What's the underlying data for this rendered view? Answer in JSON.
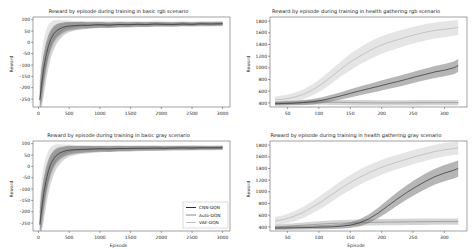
{
  "legend": {
    "entries": [
      {
        "label": "CNN-DQN",
        "color": "#2f2f2f"
      },
      {
        "label": "Auto-DQN",
        "color": "#8b8b8b"
      },
      {
        "label": "VAE-DQN",
        "color": "#c2c2c2"
      }
    ]
  },
  "chart_data": [
    {
      "type": "line",
      "title": "Reward by episode during training in basic rgb scenario",
      "xlabel": "",
      "ylabel": "Reward",
      "xlim": [
        -90,
        3120
      ],
      "ylim": [
        -285,
        112
      ],
      "xticks": [
        0,
        500,
        1000,
        1500,
        2000,
        2500,
        3000
      ],
      "yticks": [
        100,
        50,
        0,
        -50,
        -100,
        -150,
        -200,
        -250
      ],
      "show_legend": false,
      "x": [
        20,
        50,
        80,
        120,
        160,
        200,
        250,
        300,
        350,
        400,
        450,
        500,
        600,
        700,
        800,
        900,
        1000,
        1150,
        1300,
        1450,
        1600,
        1750,
        1900,
        2050,
        2200,
        2350,
        2500,
        2650,
        2800,
        2950,
        3000
      ],
      "series": [
        {
          "name": "VAE-DQN",
          "color": "#b5b5b5",
          "fill": "#cfcfcf",
          "fill_opacity": 0.55,
          "mean": [
            -245,
            -165,
            -105,
            -42,
            -2,
            24,
            44,
            56,
            63,
            67,
            71,
            73,
            75,
            76,
            77,
            78,
            78,
            79,
            79,
            80,
            80,
            80,
            81,
            81,
            81,
            82,
            81,
            82,
            82,
            82,
            82
          ],
          "band": [
            100,
            120,
            110,
            95,
            80,
            66,
            54,
            44,
            37,
            31,
            27,
            24,
            20,
            18,
            17,
            16,
            15,
            14,
            14,
            13,
            13,
            12,
            12,
            12,
            11,
            11,
            11,
            11,
            11,
            11,
            11
          ]
        },
        {
          "name": "Auto-DQN",
          "color": "#8b8b8b",
          "fill": "#9f9f9f",
          "fill_opacity": 0.45,
          "mean": [
            -250,
            -205,
            -155,
            -95,
            -48,
            -10,
            18,
            36,
            48,
            57,
            63,
            67,
            71,
            74,
            75,
            76,
            77,
            77,
            78,
            78,
            79,
            79,
            80,
            80,
            80,
            81,
            80,
            81,
            81,
            82,
            82
          ],
          "band": [
            80,
            95,
            90,
            80,
            68,
            58,
            48,
            40,
            34,
            28,
            25,
            22,
            19,
            17,
            15,
            14,
            13,
            13,
            12,
            12,
            11,
            11,
            11,
            10,
            10,
            10,
            10,
            10,
            10,
            10,
            10
          ]
        },
        {
          "name": "CNN-DQN",
          "color": "#2f2f2f",
          "fill": "#6e6e6e",
          "fill_opacity": 0.5,
          "mean": [
            -255,
            -185,
            -125,
            -62,
            -18,
            14,
            38,
            52,
            60,
            66,
            70,
            72,
            74,
            76,
            75,
            77,
            78,
            76,
            79,
            78,
            80,
            79,
            81,
            80,
            79,
            81,
            80,
            82,
            81,
            82,
            82
          ],
          "band": [
            60,
            75,
            70,
            60,
            50,
            42,
            35,
            30,
            26,
            22,
            20,
            18,
            16,
            14,
            13,
            12,
            12,
            11,
            11,
            10,
            10,
            10,
            9,
            9,
            9,
            9,
            8,
            8,
            8,
            8,
            8
          ]
        }
      ]
    },
    {
      "type": "line",
      "title": "Reward by episode during training in health gathering rgb scenario",
      "xlabel": "",
      "ylabel": "Reward",
      "xlim": [
        22,
        336
      ],
      "ylim": [
        330,
        1870
      ],
      "xticks": [
        50,
        100,
        150,
        200,
        250,
        300
      ],
      "yticks": [
        1800,
        1600,
        1400,
        1200,
        1000,
        800,
        600,
        400
      ],
      "show_legend": false,
      "x": [
        30,
        45,
        60,
        75,
        90,
        105,
        120,
        135,
        150,
        165,
        180,
        195,
        210,
        225,
        240,
        255,
        270,
        285,
        300,
        315,
        322
      ],
      "series": [
        {
          "name": "VAE-DQN",
          "color": "#b5b5b5",
          "fill": "#cfcfcf",
          "fill_opacity": 0.55,
          "mean": [
            450,
            465,
            495,
            545,
            625,
            725,
            850,
            980,
            1100,
            1200,
            1290,
            1370,
            1430,
            1480,
            1530,
            1570,
            1610,
            1640,
            1660,
            1680,
            1690
          ],
          "band": [
            60,
            65,
            75,
            85,
            95,
            110,
            120,
            130,
            140,
            145,
            150,
            150,
            150,
            148,
            145,
            142,
            140,
            138,
            135,
            132,
            130
          ]
        },
        {
          "name": "Auto-DQN",
          "color": "#8b8b8b",
          "fill": "#9f9f9f",
          "fill_opacity": 0.45,
          "mean": [
            395,
            400,
            405,
            408,
            410,
            412,
            410,
            408,
            405,
            403,
            402,
            400,
            400,
            401,
            402,
            403,
            404,
            404,
            405,
            405,
            405
          ],
          "band": [
            35,
            36,
            38,
            40,
            42,
            44,
            45,
            46,
            46,
            46,
            46,
            45,
            45,
            45,
            45,
            45,
            45,
            45,
            45,
            45,
            45
          ]
        },
        {
          "name": "CNN-DQN",
          "color": "#2f2f2f",
          "fill": "#6e6e6e",
          "fill_opacity": 0.5,
          "mean": [
            385,
            390,
            395,
            405,
            420,
            445,
            480,
            520,
            565,
            605,
            645,
            685,
            725,
            765,
            805,
            850,
            890,
            930,
            960,
            1000,
            1040
          ],
          "band": [
            30,
            32,
            35,
            40,
            45,
            52,
            58,
            64,
            70,
            75,
            80,
            84,
            88,
            92,
            95,
            98,
            100,
            103,
            105,
            108,
            110
          ]
        }
      ]
    },
    {
      "type": "line",
      "title": "Reward by episode during training in basic gray scenario",
      "xlabel": "Episode",
      "ylabel": "Reward",
      "xlim": [
        -90,
        3120
      ],
      "ylim": [
        -285,
        112
      ],
      "xticks": [
        0,
        500,
        1000,
        1500,
        2000,
        2500,
        3000
      ],
      "yticks": [
        100,
        50,
        0,
        -50,
        -100,
        -150,
        -200,
        -250
      ],
      "show_legend": true,
      "x": [
        20,
        50,
        80,
        120,
        160,
        200,
        250,
        300,
        350,
        400,
        450,
        500,
        600,
        700,
        800,
        900,
        1000,
        1150,
        1300,
        1450,
        1600,
        1750,
        1900,
        2050,
        2200,
        2350,
        2500,
        2650,
        2800,
        2950,
        3000
      ],
      "series": [
        {
          "name": "VAE-DQN",
          "color": "#b5b5b5",
          "fill": "#cfcfcf",
          "fill_opacity": 0.55,
          "mean": [
            -240,
            -170,
            -110,
            -50,
            -8,
            20,
            42,
            55,
            62,
            67,
            70,
            73,
            75,
            76,
            77,
            77,
            78,
            79,
            80,
            79,
            80,
            81,
            80,
            81,
            82,
            81,
            82,
            82,
            81,
            82,
            82
          ],
          "band": [
            105,
            118,
            108,
            92,
            78,
            64,
            52,
            43,
            36,
            30,
            26,
            23,
            20,
            18,
            16,
            15,
            15,
            14,
            13,
            13,
            12,
            12,
            12,
            11,
            11,
            11,
            11,
            11,
            10,
            10,
            10
          ]
        },
        {
          "name": "Auto-DQN",
          "color": "#8b8b8b",
          "fill": "#9f9f9f",
          "fill_opacity": 0.45,
          "mean": [
            -252,
            -208,
            -158,
            -98,
            -52,
            -14,
            15,
            34,
            46,
            55,
            62,
            66,
            70,
            73,
            74,
            75,
            76,
            77,
            78,
            78,
            79,
            79,
            79,
            80,
            80,
            80,
            81,
            81,
            81,
            82,
            82
          ],
          "band": [
            82,
            96,
            92,
            82,
            70,
            60,
            50,
            41,
            35,
            29,
            26,
            23,
            20,
            17,
            16,
            15,
            14,
            13,
            13,
            12,
            12,
            11,
            11,
            11,
            10,
            10,
            10,
            10,
            10,
            10,
            10
          ]
        },
        {
          "name": "CNN-DQN",
          "color": "#2f2f2f",
          "fill": "#6e6e6e",
          "fill_opacity": 0.5,
          "mean": [
            -258,
            -190,
            -130,
            -66,
            -22,
            10,
            35,
            50,
            59,
            65,
            69,
            72,
            74,
            75,
            76,
            77,
            78,
            77,
            79,
            79,
            80,
            80,
            81,
            80,
            81,
            82,
            81,
            82,
            82,
            82,
            83
          ],
          "band": [
            62,
            78,
            72,
            62,
            52,
            44,
            36,
            31,
            27,
            23,
            21,
            19,
            16,
            15,
            14,
            13,
            12,
            12,
            11,
            11,
            10,
            10,
            10,
            9,
            9,
            9,
            9,
            8,
            8,
            8,
            8
          ]
        }
      ]
    },
    {
      "type": "line",
      "title": "Reward by episode during training in health gathering gray scenario",
      "xlabel": "Episode",
      "ylabel": "Reward",
      "xlim": [
        22,
        336
      ],
      "ylim": [
        330,
        1870
      ],
      "xticks": [
        50,
        100,
        150,
        200,
        250,
        300
      ],
      "yticks": [
        1800,
        1600,
        1400,
        1200,
        1000,
        800,
        600,
        400
      ],
      "show_legend": false,
      "x": [
        30,
        45,
        60,
        75,
        90,
        105,
        120,
        135,
        150,
        165,
        180,
        195,
        210,
        225,
        240,
        255,
        270,
        285,
        300,
        315,
        322
      ],
      "series": [
        {
          "name": "VAE-DQN",
          "color": "#b5b5b5",
          "fill": "#cfcfcf",
          "fill_opacity": 0.55,
          "mean": [
            500,
            530,
            580,
            650,
            740,
            840,
            950,
            1060,
            1160,
            1250,
            1330,
            1400,
            1460,
            1510,
            1560,
            1610,
            1650,
            1690,
            1720,
            1740,
            1750
          ],
          "band": [
            70,
            75,
            85,
            95,
            105,
            115,
            120,
            125,
            128,
            130,
            130,
            128,
            126,
            124,
            122,
            120,
            118,
            116,
            114,
            112,
            110
          ]
        },
        {
          "name": "Auto-DQN",
          "color": "#8b8b8b",
          "fill": "#9f9f9f",
          "fill_opacity": 0.45,
          "mean": [
            400,
            410,
            420,
            430,
            440,
            450,
            458,
            465,
            470,
            474,
            477,
            480,
            482,
            484,
            486,
            488,
            489,
            490,
            490,
            491,
            491
          ],
          "band": [
            40,
            42,
            44,
            46,
            48,
            50,
            51,
            52,
            53,
            53,
            54,
            54,
            54,
            54,
            54,
            54,
            54,
            54,
            54,
            54,
            54
          ]
        },
        {
          "name": "CNN-DQN",
          "color": "#2f2f2f",
          "fill": "#6e6e6e",
          "fill_opacity": 0.5,
          "mean": [
            380,
            382,
            385,
            388,
            392,
            396,
            400,
            410,
            430,
            470,
            540,
            640,
            760,
            880,
            990,
            1090,
            1180,
            1260,
            1320,
            1370,
            1400
          ],
          "band": [
            28,
            29,
            30,
            31,
            33,
            35,
            38,
            42,
            50,
            60,
            75,
            90,
            105,
            115,
            122,
            128,
            132,
            135,
            138,
            140,
            142
          ]
        }
      ]
    }
  ]
}
